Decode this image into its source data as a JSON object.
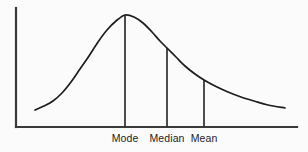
{
  "figure": {
    "background_color": "#fbfbfb",
    "line_color": "#1d1d1f",
    "axis_color": "#3a3a3c"
  },
  "chart_data": {
    "type": "line",
    "title": "",
    "subtitle": "",
    "xlabel": "",
    "ylabel": "",
    "grid": false,
    "legend": null,
    "axes": {
      "y_axis_visible": true,
      "x_axis_visible": true,
      "tick_labels_x": [],
      "tick_labels_y": [],
      "xlim": [
        0,
        1
      ],
      "ylim": [
        0,
        1
      ]
    },
    "annotations": [
      {
        "label": "Mode",
        "x_px": 125,
        "curve_y_px": 15,
        "order": 1
      },
      {
        "label": "Median",
        "x_px": 167,
        "curve_y_px": 48,
        "order": 2
      },
      {
        "label": "Mean",
        "x_px": 204,
        "curve_y_px": 80,
        "order": 3
      }
    ],
    "curve_points_px": [
      [
        35,
        110
      ],
      [
        44,
        106
      ],
      [
        53,
        101
      ],
      [
        62,
        93
      ],
      [
        71,
        82
      ],
      [
        80,
        69
      ],
      [
        89,
        56
      ],
      [
        98,
        42
      ],
      [
        107,
        30
      ],
      [
        116,
        21
      ],
      [
        125,
        15
      ],
      [
        134,
        17
      ],
      [
        143,
        23
      ],
      [
        152,
        32
      ],
      [
        160,
        41
      ],
      [
        167,
        48
      ],
      [
        176,
        57
      ],
      [
        185,
        66
      ],
      [
        195,
        74
      ],
      [
        204,
        80
      ],
      [
        215,
        86
      ],
      [
        228,
        92
      ],
      [
        241,
        97
      ],
      [
        254,
        101
      ],
      [
        268,
        105
      ],
      [
        285,
        108
      ]
    ],
    "axis_geometry_px": {
      "y_axis": {
        "x": 16,
        "y_top": 8,
        "y_bottom": 127
      },
      "x_axis": {
        "y": 127,
        "x_left": 16,
        "x_right": 297
      }
    }
  },
  "labels": {
    "mode": "Mode",
    "median": "Median",
    "mean": "Mean"
  }
}
